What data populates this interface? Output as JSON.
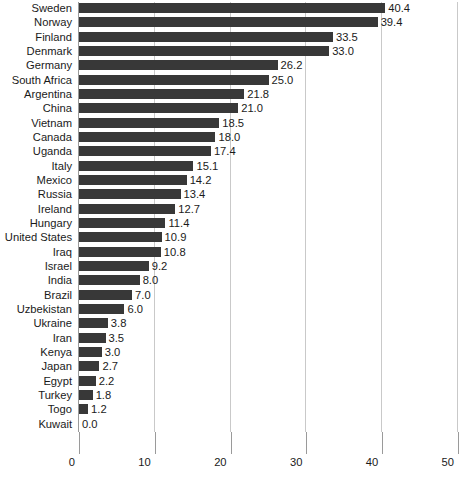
{
  "chart_data": {
    "type": "bar",
    "orientation": "horizontal",
    "title": "",
    "xlabel": "",
    "ylabel": "",
    "xlim": [
      0,
      50
    ],
    "xticks": [
      0,
      10,
      20,
      30,
      40,
      50
    ],
    "xtick_labels": [
      "0",
      "10",
      "20",
      "30",
      "40",
      "50"
    ],
    "grid": true,
    "gridlines": "vertical",
    "legend": "none",
    "bar_color": "#383838",
    "grid_color": "#c9c9c9",
    "axis_color": "#9a9a9a",
    "value_label_format": "one-decimal",
    "categories": [
      "Sweden",
      "Norway",
      "Finland",
      "Denmark",
      "Germany",
      "South Africa",
      "Argentina",
      "China",
      "Vietnam",
      "Canada",
      "Uganda",
      "Italy",
      "Mexico",
      "Russia",
      "Ireland",
      "Hungary",
      "United States",
      "Iraq",
      "Israel",
      "India",
      "Brazil",
      "Uzbekistan",
      "Ukraine",
      "Iran",
      "Kenya",
      "Japan",
      "Egypt",
      "Turkey",
      "Togo",
      "Kuwait"
    ],
    "values": [
      40.4,
      39.4,
      33.5,
      33.0,
      26.2,
      25.0,
      21.8,
      21.0,
      18.5,
      18.0,
      17.4,
      15.1,
      14.2,
      13.4,
      12.7,
      11.4,
      10.9,
      10.8,
      9.2,
      8.0,
      7.0,
      6.0,
      3.8,
      3.5,
      3.0,
      2.7,
      2.2,
      1.8,
      1.2,
      0.0
    ],
    "value_labels": [
      "40.4",
      "39.4",
      "33.5",
      "33.0",
      "26.2",
      "25.0",
      "21.8",
      "21.0",
      "18.5",
      "18.0",
      "17.4",
      "15.1",
      "14.2",
      "13.4",
      "12.7",
      "11.4",
      "10.9",
      "10.8",
      "9.2",
      "8.0",
      "7.0",
      "6.0",
      "3.8",
      "3.5",
      "3.0",
      "2.7",
      "2.2",
      "1.8",
      "1.2",
      "0.0"
    ]
  }
}
